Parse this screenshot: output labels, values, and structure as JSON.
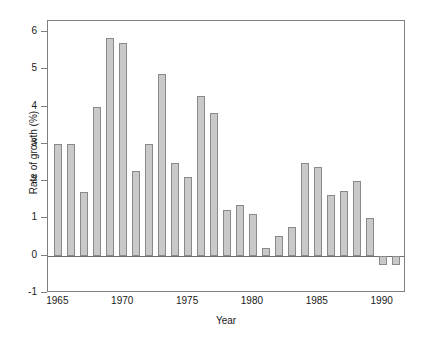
{
  "chart_data": {
    "type": "bar",
    "title": "",
    "xlabel": "Year",
    "ylabel": "Rate of growth (%)",
    "xlim": [
      1964.2,
      1991.8
    ],
    "ylim": [
      -1,
      6.3
    ],
    "grid": false,
    "legend": null,
    "xticks": [
      "1965",
      "1970",
      "1975",
      "1980",
      "1985",
      "1990"
    ],
    "xtick_values": [
      1965,
      1970,
      1975,
      1980,
      1985,
      1990
    ],
    "yticks": [
      "-1",
      "0",
      "1",
      "2",
      "3",
      "4",
      "5",
      "6"
    ],
    "ytick_values": [
      -1,
      0,
      1,
      2,
      3,
      4,
      5,
      6
    ],
    "categories": [
      1965,
      1966,
      1967,
      1968,
      1969,
      1970,
      1971,
      1972,
      1973,
      1974,
      1975,
      1976,
      1977,
      1978,
      1979,
      1980,
      1981,
      1982,
      1983,
      1984,
      1985,
      1986,
      1987,
      1988,
      1989,
      1990,
      1991
    ],
    "values": [
      3.0,
      3.0,
      1.7,
      4.0,
      5.85,
      5.72,
      2.28,
      3.0,
      4.88,
      2.5,
      2.1,
      4.3,
      3.83,
      1.23,
      1.37,
      1.12,
      0.2,
      0.53,
      0.78,
      2.5,
      2.38,
      1.62,
      1.73,
      2.0,
      1.0,
      -0.25,
      -0.25
    ],
    "bar_fill_color": "#c9c9c9",
    "bar_edge_color": "#8a8a8a",
    "axis_color": "#808080",
    "background_color": "#ffffff"
  }
}
